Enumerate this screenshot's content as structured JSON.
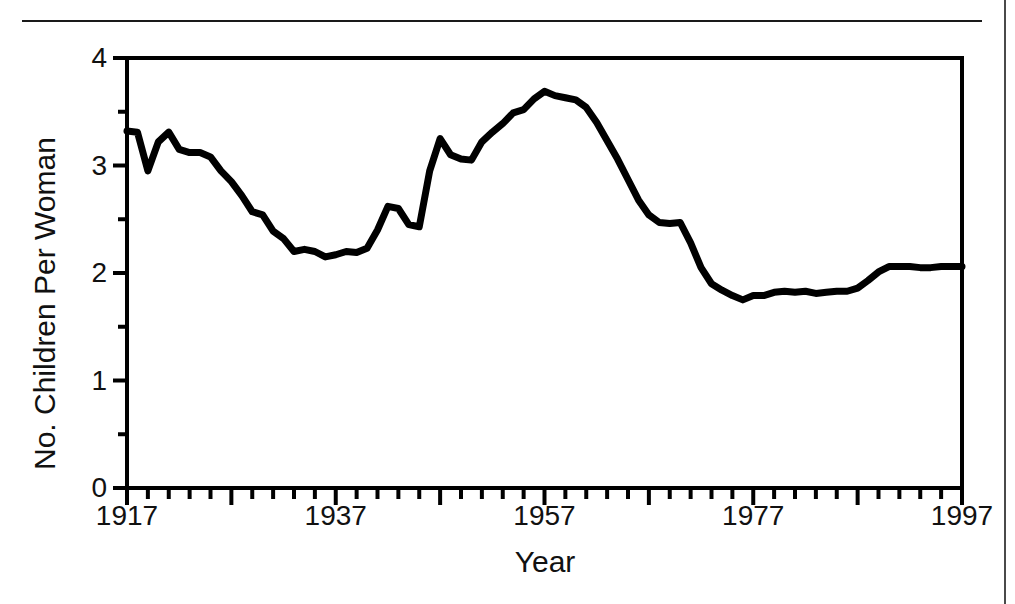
{
  "page": {
    "rule_top": "horizontal-rule",
    "rule_right": "vertical-rule"
  },
  "figure": {
    "name": "total-fertility-rate-line-chart"
  },
  "chart_data": {
    "type": "line",
    "title": "",
    "subtitle": "",
    "xlabel": "Year",
    "ylabel": "No. Children Per Woman",
    "xlim": [
      1917,
      1997
    ],
    "ylim": [
      0,
      4
    ],
    "xticks": [
      1917,
      1937,
      1957,
      1977,
      1997
    ],
    "xtick_labels": [
      "1917",
      "1937",
      "1957",
      "1977",
      "1997"
    ],
    "yticks": [
      0,
      1,
      2,
      3,
      4
    ],
    "ytick_labels": [
      "0",
      "1",
      "2",
      "3",
      "4"
    ],
    "y_minor_ticks": [
      0.5,
      1.5,
      2.5,
      3.5
    ],
    "x_minor_tick_interval": 2,
    "x_major_tick_interval": 10,
    "grid": false,
    "legend": null,
    "line_color": "#000000",
    "line_width": 7,
    "series": [
      {
        "name": "Total fertility rate",
        "x": [
          1917,
          1918,
          1919,
          1920,
          1921,
          1922,
          1923,
          1924,
          1925,
          1926,
          1927,
          1928,
          1929,
          1930,
          1931,
          1932,
          1933,
          1934,
          1935,
          1936,
          1937,
          1938,
          1939,
          1940,
          1941,
          1942,
          1943,
          1944,
          1945,
          1946,
          1947,
          1948,
          1949,
          1950,
          1951,
          1952,
          1953,
          1954,
          1955,
          1956,
          1957,
          1958,
          1959,
          1960,
          1961,
          1962,
          1963,
          1964,
          1965,
          1966,
          1967,
          1968,
          1969,
          1970,
          1971,
          1972,
          1973,
          1974,
          1975,
          1976,
          1977,
          1978,
          1979,
          1980,
          1981,
          1982,
          1983,
          1984,
          1985,
          1986,
          1987,
          1988,
          1989,
          1990,
          1991,
          1992,
          1993,
          1994,
          1995,
          1996,
          1997
        ],
        "y": [
          3.32,
          3.31,
          2.95,
          3.22,
          3.31,
          3.15,
          3.12,
          3.12,
          3.08,
          2.95,
          2.85,
          2.72,
          2.57,
          2.54,
          2.39,
          2.32,
          2.2,
          2.22,
          2.2,
          2.15,
          2.17,
          2.2,
          2.19,
          2.23,
          2.4,
          2.62,
          2.6,
          2.45,
          2.43,
          2.95,
          3.25,
          3.1,
          3.06,
          3.05,
          3.22,
          3.31,
          3.39,
          3.49,
          3.52,
          3.62,
          3.69,
          3.65,
          3.63,
          3.61,
          3.54,
          3.4,
          3.23,
          3.06,
          2.87,
          2.68,
          2.54,
          2.47,
          2.46,
          2.47,
          2.28,
          2.05,
          1.9,
          1.84,
          1.79,
          1.75,
          1.79,
          1.79,
          1.82,
          1.83,
          1.82,
          1.83,
          1.81,
          1.82,
          1.83,
          1.83,
          1.86,
          1.93,
          2.01,
          2.06,
          2.06,
          2.06,
          2.05,
          2.05,
          2.06,
          2.06,
          2.06
        ]
      }
    ]
  },
  "axes": {
    "x_label": "Year",
    "y_label": "No. Children Per Woman"
  }
}
